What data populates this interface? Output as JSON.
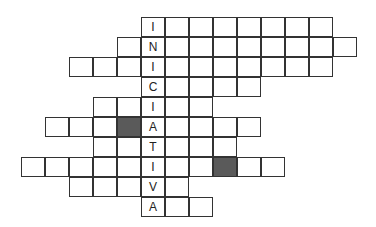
{
  "puzzle": {
    "keyword": "INICIATIVA",
    "cell_width": 24,
    "cell_height": 20,
    "origin_x": 21,
    "origin_y": 17,
    "key_column": 5,
    "colors": {
      "border": "#333333",
      "blocked": "#5a5a5a",
      "cell": "#ffffff"
    },
    "rows": [
      {
        "letter": "I",
        "start": 5,
        "length": 8,
        "blocked": []
      },
      {
        "letter": "N",
        "start": 4,
        "length": 10,
        "blocked": []
      },
      {
        "letter": "I",
        "start": 2,
        "length": 11,
        "blocked": []
      },
      {
        "letter": "C",
        "start": 5,
        "length": 5,
        "blocked": []
      },
      {
        "letter": "I",
        "start": 3,
        "length": 5,
        "blocked": []
      },
      {
        "letter": "A",
        "start": 1,
        "length": 9,
        "blocked": [
          4
        ]
      },
      {
        "letter": "T",
        "start": 3,
        "length": 6,
        "blocked": []
      },
      {
        "letter": "I",
        "start": 0,
        "length": 11,
        "blocked": [
          8
        ]
      },
      {
        "letter": "V",
        "start": 2,
        "length": 5,
        "blocked": []
      },
      {
        "letter": "A",
        "start": 5,
        "length": 3,
        "blocked": []
      }
    ]
  }
}
